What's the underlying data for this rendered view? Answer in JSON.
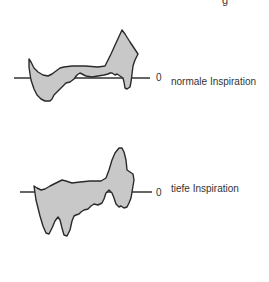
{
  "corner_glyph": "g",
  "panels": [
    {
      "zero_label": "0",
      "caption": "normale Inspiration"
    },
    {
      "zero_label": "0",
      "caption": "tiefe Inspiration"
    }
  ],
  "colors": {
    "fill": "#c8c8c8",
    "stroke": "#2a2a2a",
    "baseline": "#333333"
  }
}
